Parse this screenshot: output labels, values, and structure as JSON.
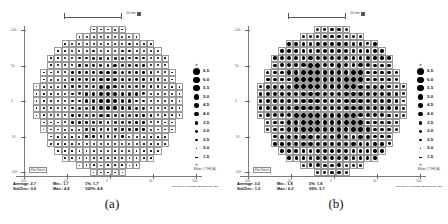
{
  "figure": {
    "background": "#ffffff",
    "panels": [
      {
        "id": "a",
        "caption": "(a)",
        "scalebar": {
          "label": "10 mm",
          "marker": "■"
        },
        "axis": {
          "x_ticks": [
            "-100",
            "-50",
            "0",
            "50",
            "100"
          ],
          "y_ticks": [
            "100",
            "50",
            "0",
            "-50",
            "-100"
          ],
          "flat_label": "Flat Notch",
          "corner_label": "Wafer 1 THK(A)"
        },
        "stats": {
          "average_label": "Average:",
          "average_value": "2.7",
          "stddev_label": "Std.Dev.:",
          "stddev_value": "0.6",
          "min_label": "Min.:",
          "min_value": "1.7",
          "max_label": "Max.:",
          "max_value": "4.8",
          "pct_low_label": "1%:",
          "pct_low_value": "1.7",
          "pct_high_label": "100%:",
          "pct_high_value": "4.8"
        },
        "brand": "WAFER CHARGING MONITORS, INC.",
        "legend": {
          "top_symbol": ">",
          "bottom_symbol": "<",
          "entries": [
            "6.5",
            "6.0",
            "5.5",
            "5.0",
            "4.5",
            "4.0",
            "3.5",
            "3.0",
            "2.5",
            "2.0",
            "1.5"
          ]
        }
      },
      {
        "id": "b",
        "caption": "(b)",
        "scalebar": {
          "label": "10 mm",
          "marker": "■"
        },
        "axis": {
          "x_ticks": [
            "-100",
            "-50",
            "0",
            "50",
            "100"
          ],
          "y_ticks": [
            "100",
            "50",
            "0",
            "-50",
            "-100"
          ],
          "flat_label": "Flat Notch",
          "corner_label": "Wafer 2 THK(A)"
        },
        "stats": {
          "average_label": "Average:",
          "average_value": "3.0",
          "stddev_label": "Std.Dev.:",
          "stddev_value": "1.2",
          "min_label": "Min.:",
          "min_value": "1.8",
          "max_label": "Max.:",
          "max_value": "6.2",
          "pct_low_label": "5%:",
          "pct_low_value": "1.8",
          "pct_high_label": "95%:",
          "pct_high_value": "5.7"
        },
        "brand": "WAFER CHARGING MONITORS, INC.",
        "legend": {
          "top_symbol": ">",
          "bottom_symbol": "<",
          "entries": [
            "6.5",
            "6.0",
            "5.5",
            "5.0",
            "4.5",
            "4.0",
            "3.5",
            "3.0",
            "2.5",
            "2.0",
            "1.5"
          ]
        }
      }
    ]
  },
  "chart_data": [
    {
      "type": "heatmap",
      "title": "(a)",
      "xlabel": "",
      "ylabel": "",
      "xlim": [
        -110,
        110
      ],
      "ylim": [
        -110,
        110
      ],
      "grid": true,
      "legend_position": "right",
      "value_bins": [
        1.5,
        2.0,
        2.5,
        3.0,
        3.5,
        4.0,
        4.5,
        5.0,
        5.5,
        6.0,
        6.5
      ],
      "units": "arbitrary (dot size = magnitude)",
      "statistics": {
        "average": 2.7,
        "stddev": 0.6,
        "min": 1.7,
        "max": 4.8,
        "pct_low": {
          "percentile": 1,
          "value": 1.7
        },
        "pct_high": {
          "percentile": 100,
          "value": 4.8
        }
      },
      "grid_cols": 21,
      "grid_rows": 21,
      "peak_center": [
        0.52,
        0.44
      ],
      "peak_value": 4.8,
      "baseline_value": 1.7,
      "radial_falloff": 0.55
    },
    {
      "type": "heatmap",
      "title": "(b)",
      "xlabel": "",
      "ylabel": "",
      "xlim": [
        -110,
        110
      ],
      "ylim": [
        -110,
        110
      ],
      "grid": true,
      "legend_position": "right",
      "value_bins": [
        1.5,
        2.0,
        2.5,
        3.0,
        3.5,
        4.0,
        4.5,
        5.0,
        5.5,
        6.0,
        6.5
      ],
      "units": "arbitrary (dot size = magnitude)",
      "statistics": {
        "average": 3.0,
        "stddev": 1.2,
        "min": 1.8,
        "max": 6.2,
        "pct_low": {
          "percentile": 5,
          "value": 1.8
        },
        "pct_high": {
          "percentile": 95,
          "value": 5.7
        }
      },
      "grid_cols": 21,
      "grid_rows": 21,
      "peak_center": [
        0.46,
        0.5
      ],
      "peak_value": 6.2,
      "baseline_value": 1.8,
      "radial_falloff": 0.92
    }
  ]
}
